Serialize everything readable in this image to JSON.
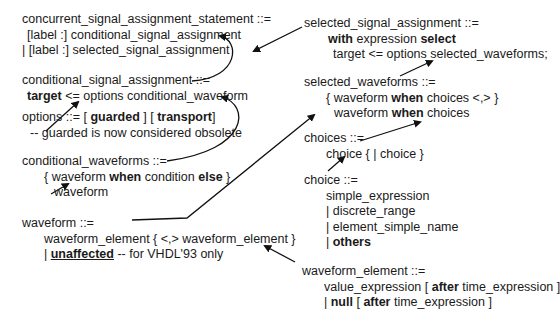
{
  "rules": {
    "concurrent": {
      "head": "concurrent_signal_assignment_statement ::=",
      "l1": "[label :] conditional_signal_assignment",
      "l2": "| [label :] selected_signal_assignment"
    },
    "conditional": {
      "head": "conditional_signal_assignment ::=",
      "kw_target": "target",
      "l1_rest": " <= options conditional_waveform"
    },
    "options": {
      "head_pre": "options ::= [ ",
      "kw_guarded": "guarded",
      "mid": " ] [ ",
      "kw_transport": "transport",
      "end": "]",
      "comment": "-- guarded is now considered obsolete"
    },
    "cond_waveforms": {
      "head": "conditional_waveforms ::=",
      "l1_a": "{ waveform ",
      "kw_when": "when",
      "l1_b": " condition ",
      "kw_else": "else",
      "l1_c": " }",
      "l2": "waveform"
    },
    "waveform": {
      "head": "waveform ::=",
      "l1": "waveform_element { <,> waveform_element }",
      "l2_a": "| ",
      "kw_unaffected": "unaffected",
      "l2_b": " -- for VHDL'93 only"
    },
    "selected": {
      "head": "selected_signal_assignment ::=",
      "kw_with": "with",
      "l1_mid": " expression ",
      "kw_select": "select",
      "l2": "target <= options selected_waveforms;"
    },
    "sel_waveforms": {
      "head": "selected_waveforms ::=",
      "l1_a": "{ waveform ",
      "kw_when": "when",
      "l1_b": " choices <,> }",
      "l2_a": "waveform ",
      "l2_b": " choices"
    },
    "choices": {
      "head": "choices ::=",
      "l1": "choice { | choice }"
    },
    "choice": {
      "head": "choice ::=",
      "l1": "simple_expression",
      "l2": "| discrete_range",
      "l3": "| element_simple_name",
      "l4_a": "| ",
      "kw_others": "others"
    },
    "waveform_element": {
      "head": "waveform_element ::=",
      "l1_a": "value_expression [ ",
      "kw_after": "after",
      "l1_b": " time_expression ]",
      "l2_a": "| ",
      "kw_null": "null",
      "l2_b": " [ ",
      "l2_c": " time_expression ]"
    }
  },
  "colors": {
    "text": "#1a1a1a",
    "arrow": "#111111",
    "background": "#ffffff"
  }
}
